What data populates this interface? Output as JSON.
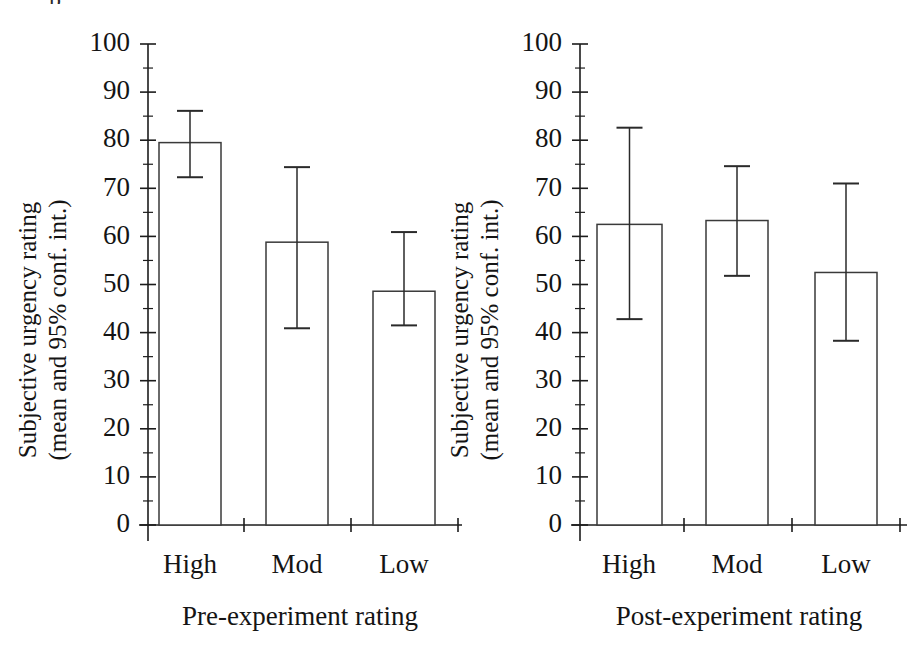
{
  "figure": {
    "background_color": "#ffffff",
    "ink_color": "#1c1c1c",
    "artifact_text": "p"
  },
  "chart_data": [
    {
      "type": "bar",
      "panel": "left",
      "title": "",
      "xlabel": "Pre-experiment rating",
      "ylabel": "Subjective urgency rating",
      "ylabel_line2": "(mean and 95% conf. int.)",
      "categories": [
        "High",
        "Mod",
        "Low"
      ],
      "values": [
        79.5,
        58.8,
        48.6
      ],
      "errors_low": [
        72.3,
        40.9,
        41.5
      ],
      "errors_high": [
        86.1,
        74.4,
        60.9
      ],
      "ylim": [
        0,
        100
      ],
      "yticks": [
        0,
        10,
        20,
        30,
        40,
        50,
        60,
        70,
        80,
        90,
        100
      ],
      "ytick_labels": [
        "0",
        "10",
        "20",
        "30",
        "40",
        "50",
        "60",
        "70",
        "80",
        "90",
        "100"
      ],
      "minor_tick_step": 5,
      "grid": false,
      "legend": "none",
      "error_label": "95% conf. int."
    },
    {
      "type": "bar",
      "panel": "right",
      "title": "",
      "xlabel": "Post-experiment rating",
      "ylabel": "Subjective urgency rating",
      "ylabel_line2": "(mean and 95% conf. int.)",
      "categories": [
        "High",
        "Mod",
        "Low"
      ],
      "values": [
        62.5,
        63.3,
        52.5
      ],
      "errors_low": [
        42.8,
        51.8,
        38.3
      ],
      "errors_high": [
        82.6,
        74.6,
        71.0
      ],
      "ylim": [
        0,
        100
      ],
      "yticks": [
        0,
        10,
        20,
        30,
        40,
        50,
        60,
        70,
        80,
        90,
        100
      ],
      "ytick_labels": [
        "0",
        "10",
        "20",
        "30",
        "40",
        "50",
        "60",
        "70",
        "80",
        "90",
        "100"
      ],
      "minor_tick_step": 5,
      "grid": false,
      "legend": "none",
      "error_label": "95% conf. int."
    }
  ]
}
